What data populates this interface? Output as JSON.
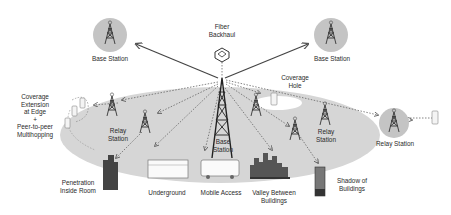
{
  "diagram": {
    "colors": {
      "background": "#ffffff",
      "coverage_area": "#d6d6d6",
      "station_circle": "#c4c4c4",
      "line": "#555555",
      "text": "#2a2a2a"
    },
    "nodes": {
      "fiber_backhaul": {
        "label_line1": "Fiber",
        "label_line2": "Backhaul"
      },
      "base_station_left": {
        "label": "Base Station"
      },
      "base_station_right": {
        "label": "Base Station"
      },
      "base_station_center": {
        "label_line1": "Base",
        "label_line2": "Station"
      },
      "coverage_hole": {
        "label_line1": "Coverage",
        "label_line2": "Hole"
      },
      "relay_station_left": {
        "label_line1": "Relay",
        "label_line2": "Station"
      },
      "relay_station_right_inner": {
        "label_line1": "Relay",
        "label_line2": "Station"
      },
      "relay_station_outer": {
        "label": "Relay Station"
      },
      "coverage_extension": {
        "lines": [
          "Coverage",
          "Extension",
          "at Edge",
          "+",
          "Peer-to-peer",
          "Multihopping"
        ]
      }
    },
    "scenarios": {
      "penetration": {
        "label_line1": "Penetration",
        "label_line2": "Inside Room"
      },
      "underground": {
        "label": "Underground"
      },
      "mobile_access": {
        "label": "Mobile Access"
      },
      "valley": {
        "label_line1": "Valley Between",
        "label_line2": "Buildings"
      },
      "shadow": {
        "label_line1": "Shadow of",
        "label_line2": "Buildings"
      }
    }
  }
}
